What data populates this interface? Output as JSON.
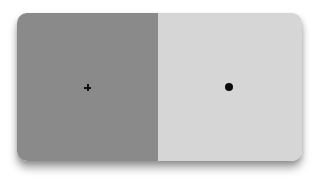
{
  "caption_fragment": "",
  "stimulus": {
    "left_panel": {
      "color": "#8a8a8a",
      "marker": "fixation-cross",
      "marker_color": "#111111"
    },
    "right_panel": {
      "color": "#d6d6d6",
      "marker": "dot",
      "marker_color": "#0a0a0a"
    }
  }
}
